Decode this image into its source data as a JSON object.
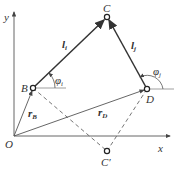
{
  "diagram": {
    "type": "four-bar linkage vector diagram",
    "axes": {
      "x_label": "x",
      "y_label": "y",
      "origin_label": "O"
    },
    "points": {
      "O": {
        "label": "O",
        "x": 14,
        "y": 136
      },
      "B": {
        "label": "B",
        "x": 33,
        "y": 88
      },
      "C": {
        "label": "C",
        "x": 107,
        "y": 17
      },
      "D": {
        "label": "D",
        "x": 147,
        "y": 89
      },
      "C_prime": {
        "label": "C′",
        "x": 107,
        "y": 151
      }
    },
    "links": [
      {
        "from": "B",
        "to": "C",
        "label": "l",
        "sub": "i",
        "style": "solid-thick"
      },
      {
        "from": "D",
        "to": "C",
        "label": "l",
        "sub": "j",
        "style": "solid-thick"
      }
    ],
    "vectors": [
      {
        "from": "O",
        "to": "B",
        "label": "r",
        "sub": "B"
      },
      {
        "from": "O",
        "to": "D",
        "label": "r",
        "sub": "D"
      }
    ],
    "dashed": [
      {
        "from": "B",
        "to": "C_prime"
      },
      {
        "from": "D",
        "to": "C_prime"
      }
    ],
    "angles": [
      {
        "at": "B",
        "label": "φ",
        "sub": "i"
      },
      {
        "at": "D",
        "label": "φ",
        "sub": "j"
      }
    ],
    "colors": {
      "line": "#444444",
      "dashed": "#666666",
      "background": "#ffffff"
    }
  }
}
